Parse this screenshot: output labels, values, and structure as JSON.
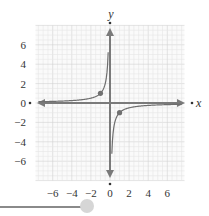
{
  "chart_data": {
    "type": "line",
    "title": "",
    "function": "y = -1/x",
    "xlabel": "x",
    "ylabel": "y",
    "xlim": [
      -8,
      8
    ],
    "ylim": [
      -8,
      8
    ],
    "grid": true,
    "x_ticks": [
      -6,
      -4,
      -2,
      0,
      2,
      4,
      6
    ],
    "x_tick_labels": [
      "−6",
      "−4",
      "−2",
      "0",
      "2",
      "4",
      "6"
    ],
    "y_ticks": [
      6,
      4,
      2,
      0,
      -2,
      -4,
      -6
    ],
    "y_tick_labels": [
      "6",
      "4",
      "2",
      "0",
      "−2",
      "−4",
      "−6"
    ],
    "series": [
      {
        "name": "branch-left",
        "x": [
          -8,
          -4,
          -2,
          -1,
          -0.5,
          -0.25,
          -0.125
        ],
        "y": [
          0.125,
          0.25,
          0.5,
          1,
          2,
          4,
          8
        ]
      },
      {
        "name": "branch-right",
        "x": [
          0.125,
          0.25,
          0.5,
          1,
          2,
          4,
          8
        ],
        "y": [
          -8,
          -4,
          -2,
          -1,
          -0.5,
          -0.25,
          -0.125
        ]
      }
    ],
    "points": [
      {
        "x": -1,
        "y": 1
      },
      {
        "x": 1,
        "y": -1
      }
    ],
    "colors": {
      "curve": "#6e6e6e",
      "axis": "#7a7a7a",
      "grid_minor": "#e6e6e6",
      "grid_major": "#d2d2d2",
      "point": "#707070"
    }
  },
  "slider": {
    "track_color": "#8a8a8a",
    "thumb_color": "#d6d6d6"
  }
}
